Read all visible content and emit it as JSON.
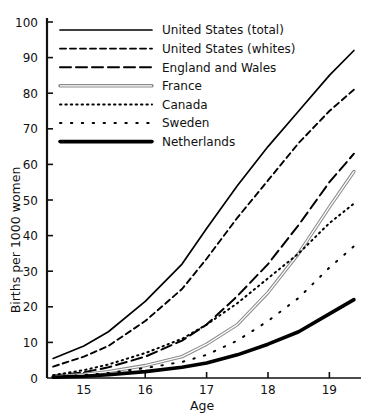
{
  "chart_data": {
    "type": "line",
    "title": "",
    "xlabel": "Age",
    "ylabel": "Births per 1000 women",
    "xlim": [
      14.4,
      19.45
    ],
    "ylim": [
      0,
      100
    ],
    "xticks": [
      15,
      16,
      17,
      18,
      19
    ],
    "yticks": [
      0,
      10,
      20,
      30,
      40,
      50,
      60,
      70,
      80,
      90,
      100
    ],
    "xtick_labels": [
      "15",
      "16",
      "17",
      "18",
      "19"
    ],
    "ytick_labels": [
      "0",
      "10",
      "20",
      "30",
      "40",
      "50",
      "60",
      "70",
      "80",
      "90",
      "100"
    ],
    "grid": false,
    "legend_position": "upper-left",
    "x": [
      14.5,
      15.0,
      15.4,
      16.0,
      16.6,
      17.0,
      17.5,
      18.0,
      18.5,
      19.0,
      19.4
    ],
    "series": [
      {
        "name": "United States (total)",
        "style": "solid-thin",
        "color": "#000000",
        "values": [
          5.5,
          9.0,
          13.0,
          21.5,
          32.0,
          42.0,
          54.0,
          65.0,
          75.0,
          85.0,
          92.0
        ]
      },
      {
        "name": "United States (whites)",
        "style": "dashed-short",
        "color": "#000000",
        "values": [
          3.2,
          6.0,
          9.0,
          16.0,
          25.0,
          33.5,
          45.0,
          55.5,
          66.0,
          75.0,
          81.0
        ]
      },
      {
        "name": "England and Wales",
        "style": "dashed-long",
        "color": "#000000",
        "values": [
          0.6,
          1.6,
          3.0,
          6.0,
          10.5,
          15.0,
          23.0,
          32.0,
          43.0,
          55.0,
          63.0
        ]
      },
      {
        "name": "France",
        "style": "double-line",
        "color": "#666666",
        "values": [
          0.4,
          1.0,
          1.8,
          3.5,
          6.0,
          9.5,
          15.0,
          24.0,
          35.0,
          48.0,
          58.0
        ]
      },
      {
        "name": "Canada",
        "style": "dotted-dense",
        "color": "#000000",
        "values": [
          0.8,
          2.2,
          3.8,
          7.0,
          11.0,
          15.0,
          21.0,
          28.0,
          35.0,
          43.5,
          49.0
        ]
      },
      {
        "name": "Sweden",
        "style": "dotted-sparse",
        "color": "#000000",
        "values": [
          0.3,
          0.8,
          1.4,
          2.8,
          4.5,
          6.5,
          10.5,
          16.0,
          22.5,
          31.0,
          37.0
        ]
      },
      {
        "name": "Netherlands",
        "style": "solid-thick",
        "color": "#000000",
        "values": [
          0.2,
          0.5,
          0.9,
          1.8,
          3.0,
          4.2,
          6.5,
          9.5,
          13.0,
          18.0,
          22.0
        ]
      }
    ]
  },
  "axes": {
    "ylabel": "Births per 1000 women",
    "xlabel": "Age"
  },
  "legend": {
    "items": [
      {
        "label": "United States (total)"
      },
      {
        "label": "United States (whites)"
      },
      {
        "label": "England and Wales"
      },
      {
        "label": "France"
      },
      {
        "label": "Canada"
      },
      {
        "label": "Sweden"
      },
      {
        "label": "Netherlands"
      }
    ]
  }
}
